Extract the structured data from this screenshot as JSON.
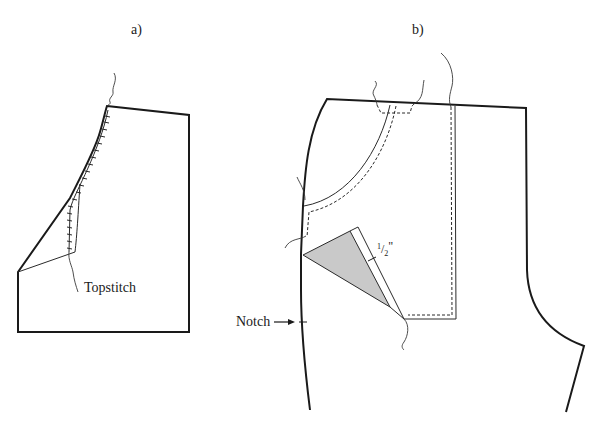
{
  "figure": {
    "panel_a": {
      "label": "a)",
      "annotations": {
        "topstitch": "Topstitch"
      }
    },
    "panel_b": {
      "label": "b)",
      "annotations": {
        "seam_allowance_num": "1",
        "seam_allowance_den": "2",
        "seam_allowance_unit": "\"",
        "notch": "Notch"
      }
    },
    "colors": {
      "line": "#1a1a1a",
      "shaded_region": "#c9c9c9",
      "background": "#ffffff"
    }
  }
}
